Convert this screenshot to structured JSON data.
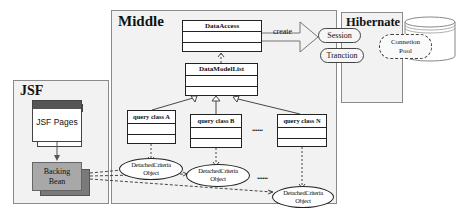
{
  "frames": {
    "jsf": {
      "title": "JSF"
    },
    "middle": {
      "title": "Middle"
    },
    "hibernate": {
      "title": "Hibernate"
    }
  },
  "jsf": {
    "pages_label": "JSF Pages",
    "backing_bean_line1": "Backing",
    "backing_bean_line2": "Bean"
  },
  "middle": {
    "data_access": "DataAccess",
    "data_model_list": "DataModelList",
    "query_classes": [
      "query class A",
      "query class B",
      "query class N"
    ],
    "ellipsis": "......",
    "create_label": "create",
    "detached_objects": [
      {
        "line1": "DetachedCriteria",
        "line2": "Object"
      },
      {
        "line1": "DetachedCriteria",
        "line2": "Object"
      },
      {
        "line1": "DetachedCriteria",
        "line2": "Object"
      }
    ]
  },
  "hibernate": {
    "session": "Session",
    "transaction": "Tranction",
    "pool_line1": "Connetion",
    "pool_line2": "Pool"
  },
  "colors": {
    "frame_bg": "#f2f2f2",
    "jsf_page_header": "#555555",
    "backing_bean": "#a8a8a8",
    "backing_bean_shadow": "#7a7a7a"
  }
}
